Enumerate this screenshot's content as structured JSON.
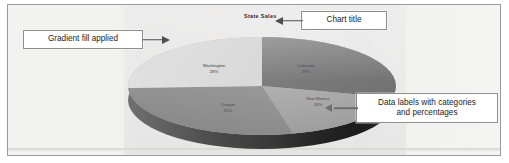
{
  "chart_data": {
    "type": "pie",
    "title": "State Sales",
    "categories": [
      "Colorado",
      "New Mexico",
      "Oregon",
      "Washington"
    ],
    "values": [
      29,
      18,
      25,
      28
    ],
    "value_unit": "%",
    "labels": [
      {
        "category": "Colorado",
        "percent": "29%"
      },
      {
        "category": "New Mexico",
        "percent": "18%"
      },
      {
        "category": "Oregon",
        "percent": "25%"
      },
      {
        "category": "Washington",
        "percent": "28%"
      }
    ],
    "legend": "none",
    "grid": false,
    "three_d": true,
    "data_labels": "category and percentage",
    "fill_style": "gradient",
    "colors": {
      "colorado": "#7d7d7d",
      "new_mexico": "#b0b0b0",
      "oregon": "#989898",
      "washington": "#d6d6d6",
      "depth": "#3a3a3a",
      "plot_background": "#eeeeed",
      "frame_border": "#9a9a9a",
      "callout_border": "#8e8e8e",
      "arrow": "#4f4f4f"
    }
  },
  "annotations": {
    "gradient": {
      "text": "Gradient fill applied"
    },
    "title": {
      "text": "Chart title"
    },
    "labels": {
      "line1": "Data labels with categories",
      "line2": "and percentages"
    }
  }
}
